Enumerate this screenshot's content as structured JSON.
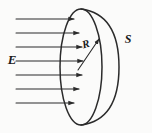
{
  "figure": {
    "labels": {
      "field": "E",
      "surface": "S",
      "radius": "R"
    },
    "colors": {
      "stroke": "#2b2b2b",
      "background": "#fbfbfa",
      "label": "#1a1a1a"
    },
    "field_lines": {
      "count": 7,
      "direction": "left-to-right",
      "x_start": 16,
      "y_positions": [
        19,
        33,
        47,
        61,
        75,
        89,
        103
      ],
      "x_end": [
        74,
        79,
        82,
        83,
        82,
        79,
        74
      ]
    },
    "rim_ellipse": {
      "center_x": 81,
      "center_y": 67,
      "radius_x": 21,
      "radius_y": 58
    },
    "bulge_arc": {
      "from_x": 81,
      "from_y": 9,
      "to_x": 81,
      "to_y": 125,
      "rightmost_x": 119
    },
    "radius_arrow": {
      "from_x": 78,
      "from_y": 70,
      "to_x": 99,
      "to_y": 39
    },
    "label_positions": {
      "field_x": 12,
      "field_y": 61,
      "surface_x": 128,
      "surface_y": 40,
      "radius_x": 86,
      "radius_y": 45
    }
  }
}
